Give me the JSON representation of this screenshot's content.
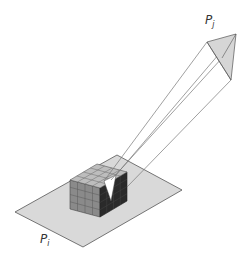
{
  "figure": {
    "labels": {
      "pj": {
        "main": "P",
        "sub": "j"
      },
      "pi": {
        "main": "P",
        "sub": "i"
      }
    },
    "colors": {
      "plane_fill": "#d9d9d9",
      "plane_stroke": "#555555",
      "cube_top": "#bdbdbd",
      "cube_front": "#8a8a8a",
      "cube_side": "#2a2a2a",
      "grid_line": "#555555",
      "target_fill": "#d6d6d6",
      "beam_stroke": "#777777"
    }
  }
}
